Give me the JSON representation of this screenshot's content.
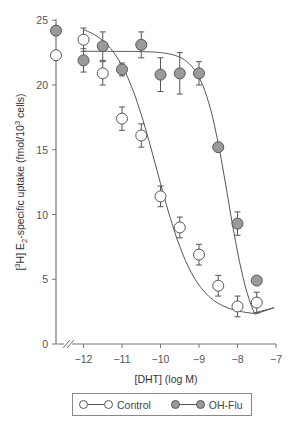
{
  "chart_data": {
    "type": "scatter",
    "title": "",
    "xlabel": "[DHT] (log M)",
    "ylabel": "[3H] E2-specific uptake (fmol/10^3 cells)",
    "ylabel_parts": {
      "pre": "[",
      "sup1": "3",
      "mid": "H] E",
      "sub": "2",
      "post": "-specific uptake (fmol/10",
      "sup2": "3",
      "end": " cells)"
    },
    "xlim": [
      -12.7,
      -7
    ],
    "ylim": [
      0,
      25
    ],
    "x_ticks": [
      -12,
      -11,
      -10,
      -9,
      -8,
      -7
    ],
    "x_tick_labels": [
      "−12",
      "−11",
      "−10",
      "−9",
      "−8",
      "−7"
    ],
    "y_ticks": [
      0,
      5,
      10,
      15,
      20,
      25
    ],
    "y_tick_labels": [
      "0",
      "5",
      "10",
      "15",
      "20",
      "25"
    ],
    "axis_break": true,
    "grid": false,
    "legend_position": "bottom",
    "basal": {
      "Control": 22.3,
      "OH-Flu": 24.2
    },
    "series": [
      {
        "name": "Control",
        "marker": "open-circle",
        "color": "#ffffff",
        "x": [
          -12,
          -11.5,
          -11,
          -10.5,
          -10,
          -9.5,
          -9,
          -8.5,
          -8,
          -7.5
        ],
        "y": [
          23.5,
          20.9,
          17.4,
          16.1,
          11.4,
          9.0,
          6.9,
          4.5,
          2.9,
          3.2
        ],
        "err": [
          0.9,
          0.9,
          0.9,
          0.9,
          0.8,
          0.8,
          0.8,
          0.8,
          0.8,
          0.8
        ]
      },
      {
        "name": "OH-Flu",
        "marker": "filled-circle",
        "color": "#9a9a9a",
        "x": [
          -12,
          -11.5,
          -11,
          -10.5,
          -10,
          -9.5,
          -9,
          -8.5,
          -8,
          -7.5
        ],
        "y": [
          21.9,
          23.0,
          21.2,
          23.1,
          20.8,
          20.9,
          20.9,
          15.2,
          9.3,
          4.9
        ],
        "err": [
          0.9,
          1.1,
          0.5,
          1.0,
          1.3,
          1.6,
          0.9,
          0.0,
          0.9,
          0.0
        ]
      }
    ]
  },
  "legend": {
    "items": [
      {
        "label": "Control"
      },
      {
        "label": "OH-Flu"
      }
    ]
  }
}
